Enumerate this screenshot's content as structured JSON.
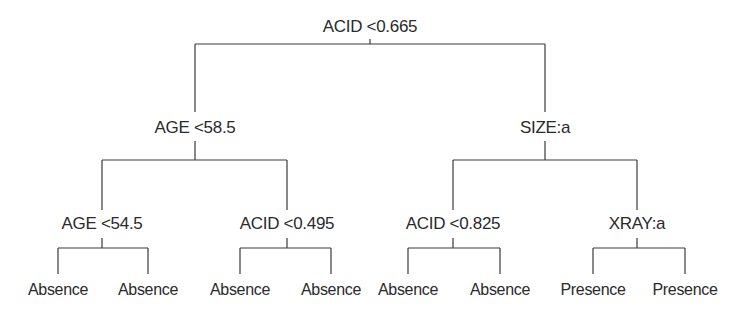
{
  "tree": {
    "root": {
      "label": "ACID <0.665",
      "x": 370,
      "y": 27
    },
    "level1": [
      {
        "label": "AGE <58.5",
        "x": 195,
        "y": 128
      },
      {
        "label": "SIZE:a",
        "x": 545,
        "y": 128
      }
    ],
    "level2": [
      {
        "label": "AGE <54.5",
        "x": 102,
        "y": 224
      },
      {
        "label": "ACID <0.495",
        "x": 287,
        "y": 224
      },
      {
        "label": "ACID <0.825",
        "x": 453,
        "y": 224
      },
      {
        "label": "XRAY:a",
        "x": 637,
        "y": 224
      }
    ],
    "leaves": [
      {
        "label": "Absence",
        "x": 58,
        "y": 290
      },
      {
        "label": "Absence",
        "x": 148,
        "y": 290
      },
      {
        "label": "Absence",
        "x": 240,
        "y": 290
      },
      {
        "label": "Absence",
        "x": 331,
        "y": 290
      },
      {
        "label": "Absence",
        "x": 408,
        "y": 290
      },
      {
        "label": "Absence",
        "x": 500,
        "y": 290
      },
      {
        "label": "Presence",
        "x": 593,
        "y": 290
      },
      {
        "label": "Presence",
        "x": 685,
        "y": 290
      }
    ],
    "line_color": "#3a3a3a"
  }
}
